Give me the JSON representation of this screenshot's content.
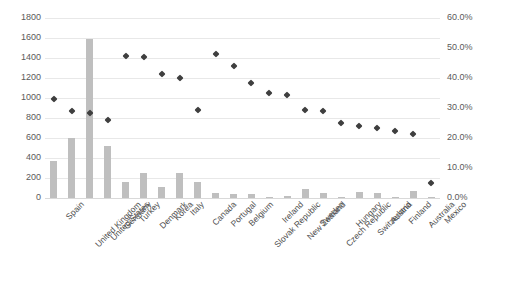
{
  "chart_data": {
    "type": "bar",
    "title": "",
    "subtitle": "",
    "xlabel": "",
    "ylabel": "",
    "y2label": "",
    "grid": true,
    "legend": "none",
    "categories": [
      "Spain",
      "United Kingdom",
      "United States",
      "Germany",
      "Turkey",
      "Denmark",
      "Korea",
      "Italy",
      "Canada",
      "Portugal",
      "Belgium",
      "Slovak Republic",
      "Ireland",
      "New Zealand",
      "Sweden",
      "Czech Republic",
      "Hungary",
      "Switzerland",
      "Austria",
      "Finland",
      "Australia",
      "Mexico"
    ],
    "series": [
      {
        "name": "Bars",
        "type": "bar",
        "axis": "left",
        "color": "#bfbfbf",
        "values": [
          370,
          600,
          1590,
          520,
          165,
          255,
          110,
          255,
          160,
          50,
          45,
          45,
          10,
          25,
          90,
          55,
          10,
          60,
          55,
          15,
          70,
          12
        ]
      },
      {
        "name": "Markers",
        "type": "scatter",
        "axis": "right",
        "color": "#3f3f3f",
        "values": [
          33.0,
          29.0,
          28.5,
          26.0,
          47.5,
          47.0,
          41.5,
          40.0,
          29.5,
          48.0,
          44.0,
          38.5,
          35.0,
          34.5,
          29.5,
          29.0,
          25.0,
          24.0,
          23.5,
          22.5,
          21.5,
          5.0
        ]
      }
    ],
    "ylim": [
      0,
      1800
    ],
    "y2lim": [
      0,
      60
    ],
    "yticks": [
      0,
      200,
      400,
      600,
      800,
      1000,
      1200,
      1400,
      1600,
      1800
    ],
    "ytick_labels": [
      "0",
      "200",
      "400",
      "600",
      "800",
      "1000",
      "1200",
      "1400",
      "1600",
      "1800"
    ],
    "y2ticks": [
      0,
      10,
      20,
      30,
      40,
      50,
      60
    ],
    "y2tick_labels": [
      "0.0%",
      "10.0%",
      "20.0%",
      "30.0%",
      "40.0%",
      "50.0%",
      "60.0%"
    ]
  }
}
